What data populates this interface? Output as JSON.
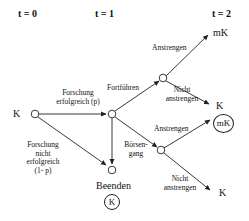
{
  "diagram": {
    "type": "decision-tree",
    "time_labels": [
      "t = 0",
      "t = 1",
      "t = 2"
    ],
    "root": {
      "label": "K"
    },
    "edges": {
      "research_success": "Forschung erfolgreich (p)",
      "research_success_line1": "Forschung",
      "research_success_line2": "erfolgreich (p)",
      "research_fail_line1": "Forschung",
      "research_fail_line2": "nicht",
      "research_fail_line3": "erfolgreich",
      "research_fail_line4": "(1- p)",
      "continue": "Fortführen",
      "ipo_line1": "Börsen-",
      "ipo_line2": "gang",
      "effort_upper": "Anstrengen",
      "no_effort_upper_line1": "Nicht",
      "no_effort_upper_line2": "anstrengen",
      "effort_lower": "Anstrengen",
      "no_effort_lower_line1": "Nicht",
      "no_effort_lower_line2": "anstrengen"
    },
    "terminals": {
      "upper_effort": "mK",
      "upper_no_effort": "K",
      "lower_effort": "mK",
      "lower_no_effort": "K",
      "stop_label": "Beenden",
      "stop_value": "K"
    }
  }
}
